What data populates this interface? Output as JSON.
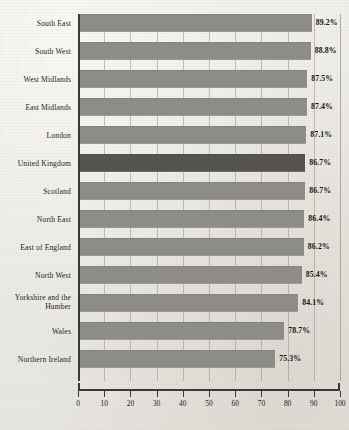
{
  "chart_data": {
    "type": "bar",
    "orientation": "horizontal",
    "title": "",
    "subtitle": "",
    "xlabel": "",
    "ylabel": "",
    "xlim": [
      0,
      100
    ],
    "xticks": [
      0,
      10,
      20,
      30,
      40,
      50,
      60,
      70,
      80,
      90,
      100
    ],
    "xtick_labels": [
      "0",
      "10",
      "20",
      "30",
      "40",
      "50",
      "60",
      "70",
      "80",
      "90",
      "100"
    ],
    "grid": "vertical",
    "legend": "none",
    "value_suffix": "%",
    "highlight_category": "United Kingdom",
    "categories": [
      "South East",
      "South West",
      "West Midlands",
      "East Midlands",
      "London",
      "United Kingdom",
      "Scotland",
      "North East",
      "East of England",
      "North West",
      "Yorkshire and the\nHumber",
      "Wales",
      "Northern Ireland"
    ],
    "values": [
      89.2,
      88.8,
      87.5,
      87.4,
      87.1,
      86.7,
      86.7,
      86.4,
      86.2,
      85.4,
      84.1,
      78.7,
      75.3
    ],
    "value_labels": [
      "89.2%",
      "88.8%",
      "87.5%",
      "87.4%",
      "87.1%",
      "86.7%",
      "86.7%",
      "86.4%",
      "86.2%",
      "85.4%",
      "84.1%",
      "78.7%",
      "75.3%"
    ],
    "bars": [
      {
        "label": "South East",
        "value": 89.2,
        "value_label": "89.2%",
        "highlight": false,
        "lines": 1
      },
      {
        "label": "South West",
        "value": 88.8,
        "value_label": "88.8%",
        "highlight": false,
        "lines": 1
      },
      {
        "label": "West Midlands",
        "value": 87.5,
        "value_label": "87.5%",
        "highlight": false,
        "lines": 1
      },
      {
        "label": "East Midlands",
        "value": 87.4,
        "value_label": "87.4%",
        "highlight": false,
        "lines": 1
      },
      {
        "label": "London",
        "value": 87.1,
        "value_label": "87.1%",
        "highlight": false,
        "lines": 1
      },
      {
        "label": "United Kingdom",
        "value": 86.7,
        "value_label": "86.7%",
        "highlight": true,
        "lines": 1
      },
      {
        "label": "Scotland",
        "value": 86.7,
        "value_label": "86.7%",
        "highlight": false,
        "lines": 1
      },
      {
        "label": "North East",
        "value": 86.4,
        "value_label": "86.4%",
        "highlight": false,
        "lines": 1
      },
      {
        "label": "East of England",
        "value": 86.2,
        "value_label": "86.2%",
        "highlight": false,
        "lines": 1
      },
      {
        "label": "North West",
        "value": 85.4,
        "value_label": "85.4%",
        "highlight": false,
        "lines": 1
      },
      {
        "label": "Yorkshire and the\nHumber",
        "value": 84.1,
        "value_label": "84.1%",
        "highlight": false,
        "lines": 2
      },
      {
        "label": "Wales",
        "value": 78.7,
        "value_label": "78.7%",
        "highlight": false,
        "lines": 1
      },
      {
        "label": "Northern Ireland",
        "value": 75.3,
        "value_label": "75.3%",
        "highlight": false,
        "lines": 1
      }
    ],
    "colors": {
      "bar": "#8e8c87",
      "bar_highlight": "#56544f",
      "axis": "#3a3833",
      "grid": "#969288",
      "background": "#edebe6",
      "text": "#201f1c"
    }
  }
}
